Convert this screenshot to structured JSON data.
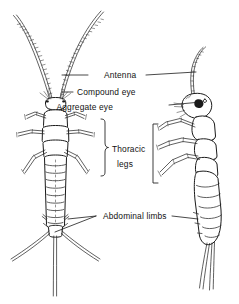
{
  "figure": {
    "name": "silverfish-anatomy-diagram",
    "background_color": "#ffffff",
    "ink_color": "#1a1a1a",
    "width": 239,
    "height": 304
  },
  "labels": {
    "antenna": "Antenna",
    "compound_eye": "Compound eye",
    "aggregate_eye": "Aggregate eye",
    "thoracic_line1": "Thoracic",
    "thoracic_line2": "legs",
    "abdominal_limbs": "Abdominal limbs"
  },
  "views": {
    "dorsal": {
      "name": "dorsal-view",
      "caption": ""
    },
    "lateral": {
      "name": "lateral-view",
      "caption": ""
    }
  }
}
